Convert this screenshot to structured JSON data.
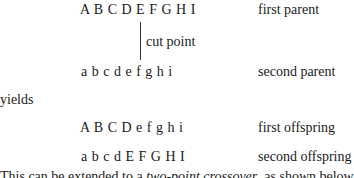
{
  "rows": [
    {
      "sequence": "A B C D E F G H I",
      "label": "first parent"
    },
    {
      "sequence": "a b c d e f g h i",
      "label": "second parent"
    },
    {
      "sequence": "A B C D e f g h i",
      "label": "first offspring"
    },
    {
      "sequence": "a b c d E F G H I",
      "label": "second offspring"
    }
  ],
  "cut_label": "cut point",
  "yields": "yields",
  "footer": {
    "before": "This can be extended to a ",
    "emph": "two-point crossover",
    "after": ", as shown below"
  }
}
